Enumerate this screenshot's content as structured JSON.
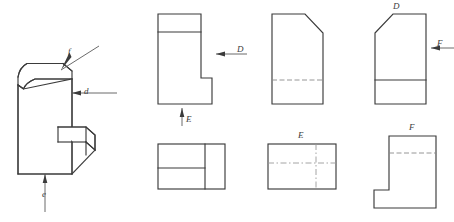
{
  "drawing": {
    "title": "Orthographic projection exercise",
    "line_color": "#3b3b3b",
    "hidden_line_color": "#8a8a8a",
    "center_line_color": "#9a9a9a",
    "background": "#ffffff"
  },
  "pictorial": {
    "name": "isometric-solid",
    "direction_labels": {
      "f": "f",
      "d": "d",
      "e": "e"
    }
  },
  "views": {
    "top_row": [
      {
        "id": "view-1",
        "shape": "l-shaped-profile",
        "labels": [
          {
            "text": "D",
            "position": "right"
          },
          {
            "text": "E",
            "position": "bottom"
          }
        ]
      },
      {
        "id": "view-2",
        "shape": "chamfered-rectangle",
        "labels": []
      },
      {
        "id": "view-3",
        "shape": "chamfered-rectangle-mirrored",
        "labels": [
          {
            "text": "D",
            "position": "top"
          },
          {
            "text": "F",
            "position": "right"
          }
        ]
      }
    ],
    "bottom_row": [
      {
        "id": "view-4",
        "shape": "divided-rectangle",
        "labels": []
      },
      {
        "id": "view-5",
        "shape": "rectangle-with-center-lines",
        "labels": [
          {
            "text": "E",
            "position": "top"
          }
        ]
      },
      {
        "id": "view-6",
        "shape": "notched-rectangle",
        "labels": [
          {
            "text": "F",
            "position": "top"
          }
        ]
      }
    ]
  },
  "labels": {
    "iso_f": "f",
    "iso_d": "d",
    "iso_e": "e",
    "v1_D": "D",
    "v1_E": "E",
    "v3_D": "D",
    "v3_F": "F",
    "v5_E": "E",
    "v6_F": "F"
  }
}
